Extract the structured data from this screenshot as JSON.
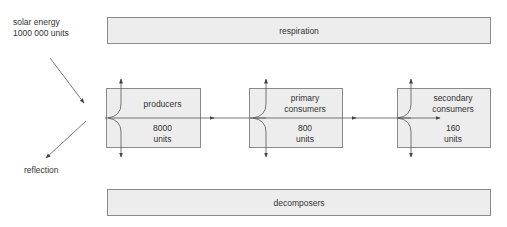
{
  "diagram": {
    "type": "energy-flow",
    "source": {
      "line1": "solar energy",
      "line2": "1000 000 units"
    },
    "reflection": "reflection",
    "respiration": "respiration",
    "decomposers": "decomposers",
    "levels": [
      {
        "name1": "producers",
        "name2": "",
        "value": "8000",
        "unit": "units"
      },
      {
        "name1": "primary",
        "name2": "consumers",
        "value": "800",
        "unit": "units"
      },
      {
        "name1": "secondary",
        "name2": "consumers",
        "value": "160",
        "unit": "units"
      }
    ],
    "colors": {
      "box_fill": "#ededed",
      "box_border": "#8a8a8a",
      "line": "#444444",
      "text": "#333333"
    }
  }
}
